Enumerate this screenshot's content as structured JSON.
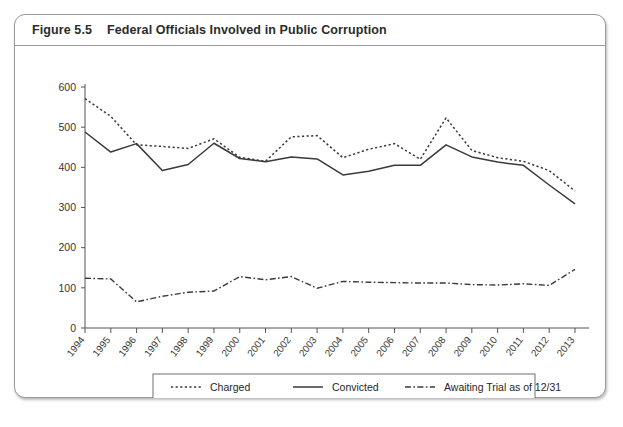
{
  "figure": {
    "number": "Figure 5.5",
    "title": "Federal Officials Involved in Public Corruption"
  },
  "chart_data": {
    "type": "line",
    "title": "Federal Officials Involved in Public Corruption",
    "xlabel": "",
    "ylabel": "",
    "ylim": [
      0,
      600
    ],
    "ytick_labels": [
      "0",
      "100",
      "200",
      "300",
      "400",
      "500",
      "600"
    ],
    "ytick_values": [
      0,
      100,
      200,
      300,
      400,
      500,
      600
    ],
    "grid": false,
    "legend_position": "bottom-center",
    "x": [
      "1994",
      "1995",
      "1996",
      "1997",
      "1998",
      "1999",
      "2000",
      "2001",
      "2002",
      "2003",
      "2004",
      "2005",
      "2006",
      "2007",
      "2008",
      "2009",
      "2010",
      "2011",
      "2012",
      "2013"
    ],
    "series": [
      {
        "name": "Charged",
        "style": "dotted",
        "values": [
          571,
          527,
          456,
          452,
          447,
          471,
          425,
          415,
          476,
          479,
          424,
          445,
          459,
          420,
          523,
          442,
          424,
          415,
          392,
          341
        ]
      },
      {
        "name": "Convicted",
        "style": "solid",
        "values": [
          488,
          438,
          459,
          392,
          407,
          460,
          422,
          414,
          426,
          421,
          381,
          390,
          405,
          405,
          456,
          426,
          413,
          405,
          356,
          309
        ]
      },
      {
        "name": "Awaiting Trial as of 12/31",
        "style": "dash-dot",
        "values": [
          124,
          122,
          65,
          79,
          89,
          92,
          128,
          120,
          128,
          99,
          116,
          114,
          113,
          112,
          112,
          108,
          107,
          110,
          106,
          146
        ]
      }
    ]
  },
  "legend": {
    "items": [
      {
        "label": "Charged",
        "style": "dotted"
      },
      {
        "label": "Convicted",
        "style": "solid"
      },
      {
        "label": "Awaiting Trial as of 12/31",
        "style": "dash-dot"
      }
    ]
  },
  "colors": {
    "ink": "#3a3a3a",
    "card_border": "#9a9a9a",
    "background": "#ffffff"
  }
}
